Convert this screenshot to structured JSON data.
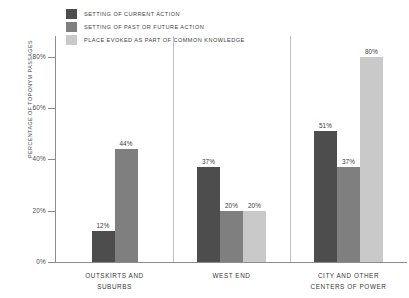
{
  "chart_data": {
    "type": "bar",
    "title": "",
    "subtitle": "",
    "xlabel": "",
    "ylabel": "PERCENTAGE OF TOPONYM PASSAGES",
    "ylim": [
      0,
      88
    ],
    "ytick_labels": [
      "0%",
      "20%",
      "40%",
      "60%",
      "80%"
    ],
    "ytick_values": [
      0,
      20,
      40,
      60,
      80
    ],
    "grid": false,
    "legend_position": "top-left",
    "categories": [
      "OUTSKIRTS AND SUBURBS",
      "WEST END",
      "CITY AND OTHER CENTERS OF POWER"
    ],
    "category_lines": [
      [
        "OUTSKIRTS AND",
        "SUBURBS"
      ],
      [
        "WEST END",
        ""
      ],
      [
        "CITY AND OTHER",
        "CENTERS OF POWER"
      ]
    ],
    "series": [
      {
        "name": "SETTING OF CURRENT ACTION",
        "color": "#4d4d4d",
        "values": [
          12,
          37,
          51
        ],
        "labels": [
          "12%",
          "37%",
          "51%"
        ]
      },
      {
        "name": "SETTING OF PAST OR FUTURE ACTION",
        "color": "#7f7f7f",
        "values": [
          44,
          20,
          37
        ],
        "labels": [
          "44%",
          "20%",
          "37%"
        ]
      },
      {
        "name": "PLACE EVOKED AS PART OF COMMON KNOWLEDGE",
        "color": "#c9c9c9",
        "values": [
          null,
          20,
          80
        ],
        "labels": [
          "",
          "20%",
          "80%"
        ]
      }
    ]
  },
  "axis": {
    "line_color": "#8c8c8c",
    "separator_color": "#bfbfbf"
  }
}
